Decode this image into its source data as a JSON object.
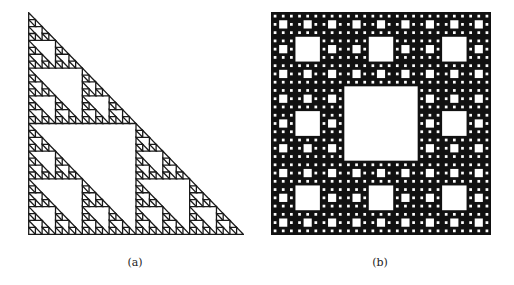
{
  "figures": [
    {
      "id": "a",
      "label": "(a)",
      "type": "sierpinski-triangle",
      "description": "Right-angled Sierpinski triangle fractal",
      "depth": 5,
      "color": "#1a1a1a"
    },
    {
      "id": "b",
      "label": "(b)",
      "type": "sierpinski-carpet",
      "description": "Sierpinski carpet fractal",
      "depth": 4,
      "color": "#111111"
    }
  ]
}
